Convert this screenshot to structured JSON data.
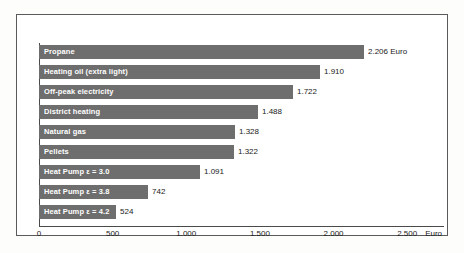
{
  "chart_data": {
    "type": "bar",
    "orientation": "horizontal",
    "title": "",
    "xlabel": "Euro",
    "ylabel": "",
    "xlim": [
      0,
      2750
    ],
    "grid": false,
    "legend": null,
    "currency_unit": "Euro",
    "axis_unit_label": "Euro",
    "tick_labels": [
      "0",
      "500",
      "1.000",
      "1.500",
      "2.000",
      "2.500"
    ],
    "tick_values": [
      0,
      500,
      1000,
      1500,
      2000,
      2500
    ],
    "categories": [
      "Propane",
      "Heating oil (extra light)",
      "Off-peak electricity",
      "District heating",
      "Natural gas",
      "Pellets",
      "Heat Pump ε = 3.0",
      "Heat Pump ε = 3.8",
      "Heat Pump ε = 4.2"
    ],
    "values": [
      2206,
      1910,
      1722,
      1488,
      1328,
      1322,
      1091,
      742,
      524
    ],
    "value_labels": [
      "2.206 Euro",
      "1.910",
      "1.722",
      "1.488",
      "1.328",
      "1.322",
      "1.091",
      "742",
      "524"
    ],
    "bars": [
      {
        "label": "Propane",
        "value": 2206,
        "value_label": "2.206 Euro"
      },
      {
        "label": "Heating oil (extra light)",
        "value": 1910,
        "value_label": "1.910"
      },
      {
        "label": "Off-peak electricity",
        "value": 1722,
        "value_label": "1.722"
      },
      {
        "label": "District heating",
        "value": 1488,
        "value_label": "1.488"
      },
      {
        "label": "Natural gas",
        "value": 1328,
        "value_label": "1.328"
      },
      {
        "label": "Pellets",
        "value": 1322,
        "value_label": "1.322"
      },
      {
        "label": "Heat Pump ε = 3.0",
        "value": 1091,
        "value_label": "1.091"
      },
      {
        "label": "Heat Pump ε = 3.8",
        "value": 742,
        "value_label": "742"
      },
      {
        "label": "Heat Pump ε = 4.2",
        "value": 524,
        "value_label": "524"
      }
    ],
    "colors": {
      "bar": "#6e6e6e",
      "bar_label_text": "#ffffff",
      "value_label_text": "#1a1a1a",
      "axis": "#4a4a4a",
      "frame": "#5a5a5a",
      "background": "#ffffff"
    }
  }
}
